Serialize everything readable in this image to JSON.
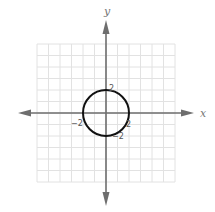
{
  "chart_data": {
    "type": "line",
    "title": "",
    "xlabel": "x",
    "ylabel": "y",
    "xlim": [
      -6,
      6
    ],
    "ylim": [
      -6,
      6
    ],
    "grid": true,
    "legend": null,
    "series": [
      {
        "name": "circle",
        "shape": "circle",
        "center": [
          0,
          0
        ],
        "radius": 2,
        "equation": "x^2 + y^2 = 4"
      }
    ],
    "annotations": [
      {
        "text": "2",
        "x": 0,
        "y": 2,
        "position": "upper-right"
      },
      {
        "text": "−2",
        "x": -2,
        "y": 0,
        "position": "lower-left"
      },
      {
        "text": "2",
        "x": 2,
        "y": 0,
        "position": "lower-right"
      },
      {
        "text": "−2",
        "x": 0,
        "y": -2,
        "position": "lower-right"
      }
    ]
  },
  "labels": {
    "x_axis": "x",
    "y_axis": "y",
    "top": "2",
    "left": "−2",
    "right": "2",
    "bottom": "−2"
  },
  "colors": {
    "grid": "#e2e2e2",
    "axis": "#6e6e6e",
    "curve": "#111111",
    "text": "#666666"
  }
}
